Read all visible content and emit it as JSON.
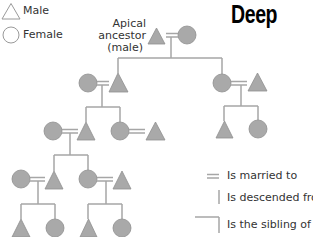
{
  "title": "Deep",
  "legend_top": {
    "male": {
      "label": "Male",
      "icon": "triangle-outline-icon"
    },
    "female": {
      "label": "Female",
      "icon": "circle-outline-icon"
    }
  },
  "apical_ancestor": {
    "line1": "Apical",
    "line2": "ancestor",
    "line3": "(male)"
  },
  "legend_bottom": {
    "married": {
      "label": "Is married to",
      "icon": "double-line-icon"
    },
    "descended": {
      "label": "Is descended from",
      "icon": "vertical-line-icon"
    },
    "sibling": {
      "label": "Is the sibling of",
      "icon": "bracket-line-icon"
    }
  },
  "colors": {
    "node_fill": "#a9a9a9",
    "node_stroke": "#8f8f8f",
    "line": "#a6a6a6",
    "legend_stroke": "#9a9a9a",
    "text": "#333333"
  },
  "diagram": {
    "type": "kinship-chart",
    "generations": [
      {
        "gen": 1,
        "couples": [
          "apical male = female"
        ]
      },
      {
        "gen": 2,
        "couples": [
          "female = male (left, son of apical)",
          "female (right, daughter of apical) = male"
        ]
      },
      {
        "gen": 3,
        "couples": [
          "female = male (son)",
          "female (daughter) = male"
        ],
        "other": [
          "male",
          "female (children of right branch)"
        ]
      },
      {
        "gen": 4,
        "couples": [
          "female = male (son)",
          "female (daughter) = male"
        ]
      },
      {
        "gen": 5,
        "children": [
          "male",
          "female",
          "male",
          "female"
        ]
      }
    ]
  }
}
